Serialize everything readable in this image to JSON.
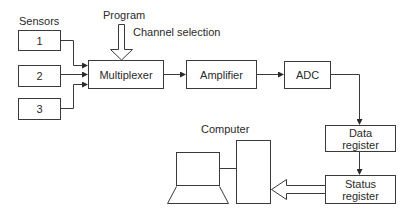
{
  "diagram": {
    "title_labels": {
      "sensors": "Sensors",
      "program": "Program",
      "channel_selection": "Channel selection",
      "computer": "Computer"
    },
    "sensors": [
      {
        "label": "1"
      },
      {
        "label": "2"
      },
      {
        "label": "3"
      }
    ],
    "blocks": {
      "multiplexer": "Multiplexer",
      "amplifier": "Amplifier",
      "adc": "ADC",
      "data_register_line1": "Data",
      "data_register_line2": "register",
      "status_register_line1": "Status",
      "status_register_line2": "register"
    },
    "connections": [
      {
        "from": "Sensor 1",
        "to": "Multiplexer"
      },
      {
        "from": "Sensor 2",
        "to": "Multiplexer"
      },
      {
        "from": "Sensor 3",
        "to": "Multiplexer"
      },
      {
        "from": "Program",
        "to": "Multiplexer",
        "style": "hollow-arrow"
      },
      {
        "from": "Multiplexer",
        "to": "Amplifier"
      },
      {
        "from": "Amplifier",
        "to": "ADC"
      },
      {
        "from": "ADC",
        "to": "Data register"
      },
      {
        "from": "Data register",
        "to": "Status register"
      },
      {
        "from": "Status register",
        "to": "Computer",
        "style": "hollow-arrow"
      }
    ],
    "colors": {
      "stroke": "#3a3a3a",
      "background": "#ffffff"
    }
  }
}
